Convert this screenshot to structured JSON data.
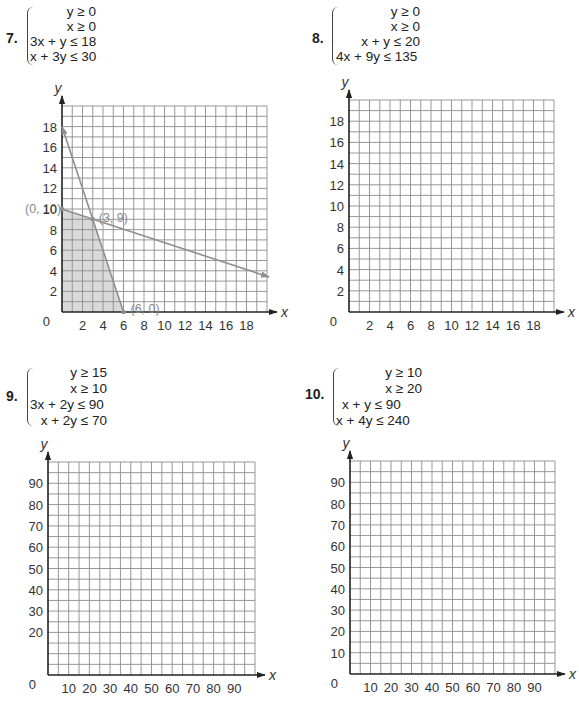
{
  "problems": [
    {
      "number": "7.",
      "inequalities": [
        "y ≥ 0",
        "x ≥ 0",
        "3x + y ≤ 18",
        "x + 3y ≤ 30"
      ],
      "graph": {
        "origin_px": [
          62,
          312
        ],
        "unit_px": [
          10.25,
          10.3
        ],
        "cells_x": 20,
        "cells_y": 20,
        "cell_units": 1,
        "x_ticks": [
          2,
          4,
          6,
          8,
          10,
          12,
          14,
          16,
          18
        ],
        "y_ticks": [
          2,
          4,
          6,
          8,
          10,
          12,
          14,
          16,
          18
        ],
        "origin_label": "0",
        "x_label": "x",
        "y_label": "y",
        "shaded_region": [
          [
            0,
            0
          ],
          [
            0,
            10
          ],
          [
            3,
            9
          ],
          [
            6,
            0
          ]
        ],
        "lines": [
          {
            "name": "3x + y = 18",
            "from": [
              6,
              0
            ],
            "to": [
              0,
              18
            ]
          },
          {
            "name": "x + 3y = 30",
            "from": [
              0,
              10
            ],
            "to": [
              20.2,
              3.4
            ]
          }
        ],
        "vertices": [
          {
            "label": "(0, 10)",
            "point": [
              0,
              10
            ],
            "offset": [
              -37,
              0
            ]
          },
          {
            "label": "(3, 9)",
            "point": [
              3,
              9
            ],
            "offset": [
              6,
              -1
            ]
          },
          {
            "label": "(6, 0)",
            "point": [
              6,
              0
            ],
            "offset": [
              7,
              -3
            ]
          }
        ]
      }
    },
    {
      "number": "8.",
      "inequalities": [
        "y ≥ 0",
        "x ≥ 0",
        "x + y ≤ 20",
        "4x + 9y ≤ 135"
      ],
      "graph": {
        "origin_px": [
          349,
          312
        ],
        "unit_px": [
          10.25,
          10.6
        ],
        "cells_x": 20,
        "cells_y": 20,
        "cell_units": 1,
        "x_ticks": [
          2,
          4,
          6,
          8,
          10,
          12,
          14,
          16,
          18
        ],
        "y_ticks": [
          2,
          4,
          6,
          8,
          10,
          12,
          14,
          16,
          18
        ],
        "origin_label": "0",
        "x_label": "x",
        "y_label": "y",
        "shaded_region": [],
        "lines": [],
        "vertices": []
      }
    },
    {
      "number": "9.",
      "inequalities": [
        "y ≥ 15",
        "x ≥ 10",
        "3x + 2y ≤ 90",
        "x + 2y ≤ 70"
      ],
      "graph": {
        "origin_px": [
          48,
          675
        ],
        "unit_px": [
          2.07,
          2.13
        ],
        "cells_x": 20,
        "cells_y": 20,
        "cell_units": 5,
        "x_ticks": [
          10,
          20,
          30,
          40,
          50,
          60,
          70,
          80,
          90
        ],
        "y_ticks": [
          20,
          30,
          40,
          50,
          60,
          70,
          80,
          90
        ],
        "origin_label": "0",
        "x_label": "x",
        "y_label": "y",
        "shaded_region": [],
        "lines": [],
        "vertices": []
      }
    },
    {
      "number": "10.",
      "inequalities": [
        "y ≥ 10",
        "x ≥ 20",
        "x + y ≤ 90",
        "x + 4y ≤ 240"
      ],
      "graph": {
        "origin_px": [
          350,
          674
        ],
        "unit_px": [
          2.05,
          2.13
        ],
        "cells_x": 20,
        "cells_y": 20,
        "cell_units": 5,
        "x_ticks": [
          10,
          20,
          30,
          40,
          50,
          60,
          70,
          80,
          90
        ],
        "y_ticks": [
          10,
          20,
          30,
          40,
          50,
          60,
          70,
          80,
          90
        ],
        "origin_label": "0",
        "x_label": "x",
        "y_label": "y",
        "shaded_region": [],
        "lines": [],
        "vertices": []
      }
    }
  ],
  "colors": {
    "grid": "#8c8c8c",
    "axis": "#222222",
    "constraint_line": "#8f8f8f",
    "shaded_fill": "#d9d9d9",
    "vertex_label": "#8a8a8a"
  },
  "chart_data": [
    {
      "type": "line",
      "title": "7. y ≥ 0, x ≥ 0, 3x + y ≤ 18, x + 3y ≤ 30",
      "xlabel": "x",
      "ylabel": "y",
      "xlim": [
        0,
        20
      ],
      "ylim": [
        0,
        20
      ],
      "grid": true,
      "x_ticks": [
        2,
        4,
        6,
        8,
        10,
        12,
        14,
        16,
        18
      ],
      "y_ticks": [
        2,
        4,
        6,
        8,
        10,
        12,
        14,
        16,
        18
      ],
      "series": [
        {
          "name": "3x + y = 18",
          "x": [
            0,
            6
          ],
          "y": [
            18,
            0
          ]
        },
        {
          "name": "x + 3y = 30",
          "x": [
            0,
            20
          ],
          "y": [
            10,
            3.33
          ]
        }
      ],
      "feasible_region": [
        [
          0,
          0
        ],
        [
          0,
          10
        ],
        [
          3,
          9
        ],
        [
          6,
          0
        ]
      ],
      "annotations": [
        "(0, 10)",
        "(3, 9)",
        "(6, 0)"
      ]
    },
    {
      "type": "line",
      "title": "8. y ≥ 0, x ≥ 0, x + y ≤ 20, 4x + 9y ≤ 135",
      "xlabel": "x",
      "ylabel": "y",
      "xlim": [
        0,
        20
      ],
      "ylim": [
        0,
        20
      ],
      "grid": true,
      "x_ticks": [
        2,
        4,
        6,
        8,
        10,
        12,
        14,
        16,
        18
      ],
      "y_ticks": [
        2,
        4,
        6,
        8,
        10,
        12,
        14,
        16,
        18
      ],
      "series": []
    },
    {
      "type": "line",
      "title": "9. y ≥ 15, x ≥ 10, 3x + 2y ≤ 90, x + 2y ≤ 70",
      "xlabel": "x",
      "ylabel": "y",
      "xlim": [
        0,
        100
      ],
      "ylim": [
        0,
        100
      ],
      "grid": true,
      "x_ticks": [
        10,
        20,
        30,
        40,
        50,
        60,
        70,
        80,
        90
      ],
      "y_ticks": [
        20,
        30,
        40,
        50,
        60,
        70,
        80,
        90
      ],
      "series": []
    },
    {
      "type": "line",
      "title": "10. y ≥ 10, x ≥ 20, x + y ≤ 90, x + 4y ≤ 240",
      "xlabel": "x",
      "ylabel": "y",
      "xlim": [
        0,
        100
      ],
      "ylim": [
        0,
        100
      ],
      "grid": true,
      "x_ticks": [
        10,
        20,
        30,
        40,
        50,
        60,
        70,
        80,
        90
      ],
      "y_ticks": [
        10,
        20,
        30,
        40,
        50,
        60,
        70,
        80,
        90
      ],
      "series": []
    }
  ]
}
